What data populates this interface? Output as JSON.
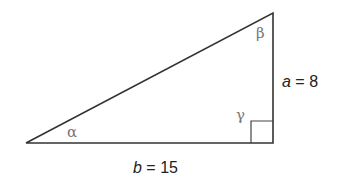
{
  "diagram": {
    "type": "right-triangle",
    "stroke_color": "#333333",
    "greek_color": "#777777",
    "vertices": {
      "left": [
        26,
        143
      ],
      "top": [
        273,
        13
      ],
      "right_angle": [
        273,
        143
      ]
    },
    "right_angle_marker_size": 22,
    "angles": {
      "alpha": "α",
      "beta": "β",
      "gamma": "γ"
    },
    "sides": {
      "a": {
        "var": "a",
        "eq": " = 8",
        "value": 8
      },
      "b": {
        "var": "b",
        "eq": " = 15",
        "value": 15
      }
    }
  }
}
